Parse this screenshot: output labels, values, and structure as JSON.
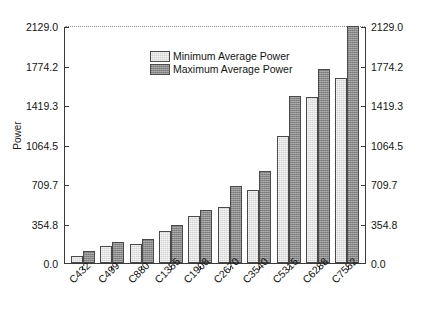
{
  "chart_data": {
    "type": "bar",
    "title": "",
    "xlabel": "",
    "ylabel": "Power",
    "ylim": [
      0.0,
      2129.0
    ],
    "grid": false,
    "top_gridline": true,
    "legend_position": "upper center",
    "categories": [
      "C432",
      "C499",
      "C880",
      "C1355",
      "C1908",
      "C2670",
      "C3540",
      "C5315",
      "C6288",
      "C7552"
    ],
    "ytick_labels": [
      "0.0",
      "354.8",
      "709.7",
      "1064.5",
      "1419.3",
      "1774.2",
      "2129.0"
    ],
    "ytick_values": [
      0.0,
      354.8,
      709.7,
      1064.5,
      1419.3,
      1774.2,
      2129.0
    ],
    "series": [
      {
        "name": "Minimum Average Power",
        "color": "#d2d2d2",
        "values": [
          62.0,
          152.0,
          170.0,
          287.0,
          421.0,
          502.0,
          655.0,
          1140.0,
          1490.0,
          1660.0
        ]
      },
      {
        "name": "Maximum Average Power",
        "color": "#8a8a8a",
        "values": [
          108.0,
          190.0,
          215.0,
          340.0,
          480.0,
          690.0,
          825.0,
          1500.0,
          1740.0,
          2129.0
        ]
      }
    ]
  },
  "axes": {
    "left_ticks": [
      "2129.0",
      "1774.2",
      "1419.3",
      "1064.5",
      "709.7",
      "354.8",
      "0.0"
    ],
    "right_ticks": [
      "2129.0",
      "1774.2",
      "1419.3",
      "1064.5",
      "709.7",
      "354.8",
      "0.0"
    ],
    "y_axis_title": "Power"
  },
  "legend": {
    "items": [
      {
        "label": "Minimum Average Power",
        "swatch": "min"
      },
      {
        "label": "Maximum Average Power",
        "swatch": "max"
      }
    ]
  },
  "colors": {
    "bar_min": "#d2d2d2",
    "bar_max": "#8a8a8a",
    "bar_border": "#4a4a4a",
    "axis": "#3b3b3b",
    "text": "#141414",
    "background": "#ffffff"
  }
}
